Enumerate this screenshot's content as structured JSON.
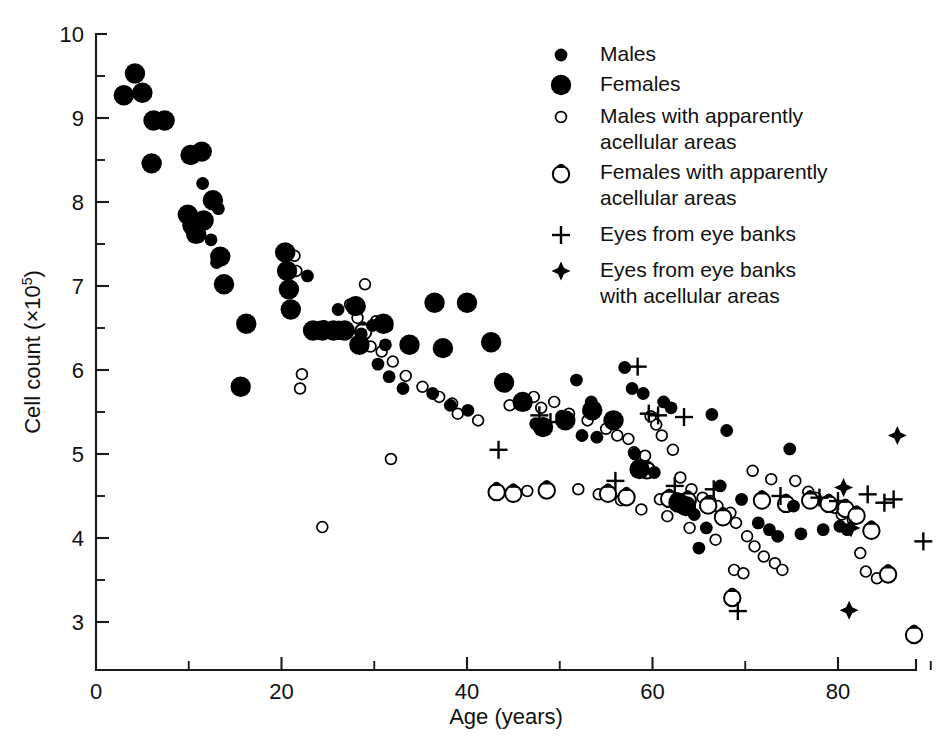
{
  "figure": {
    "width": 939,
    "height": 748,
    "background": "#ffffff",
    "ink_color": "#000000"
  },
  "axes": {
    "x_title": "Age (years)",
    "y_title_main": "Cell count (×10",
    "y_title_sup": "5",
    "y_title_tail": ")",
    "x_ticks": [
      "0",
      "20",
      "40",
      "60",
      "80"
    ],
    "y_ticks": [
      "3",
      "4",
      "5",
      "6",
      "7",
      "8",
      "9",
      "10"
    ]
  },
  "legend": {
    "items": [
      {
        "marker": "small-filled-circle",
        "label": "Males",
        "label2": ""
      },
      {
        "marker": "large-filled-circle",
        "label": "Females",
        "label2": ""
      },
      {
        "marker": "small-open-circle",
        "label": "Males with apparently",
        "label2": "acellular areas"
      },
      {
        "marker": "large-open-circle-notched",
        "label": "Females with apparently",
        "label2": "acellular areas"
      },
      {
        "marker": "plus",
        "label": "Eyes from eye banks",
        "label2": ""
      },
      {
        "marker": "filled-diamond-star",
        "label": "Eyes from eye banks",
        "label2": "with acellular areas"
      }
    ]
  },
  "chart_data": {
    "type": "scatter",
    "title": "",
    "xlabel": "Age (years)",
    "ylabel": "Cell count (×10^5)",
    "xlim": [
      0,
      90
    ],
    "ylim": [
      2.6,
      10
    ],
    "grid": false,
    "legend_position": "top-right",
    "x_major_step": 20,
    "x_minor_step": 10,
    "y_major_step": 1,
    "y_minor_step": 0.5,
    "series": [
      {
        "name": "Males",
        "marker": "small-filled-circle",
        "points": [
          [
            11.5,
            8.22
          ],
          [
            13.2,
            7.92
          ],
          [
            12.4,
            7.55
          ],
          [
            13.0,
            7.28
          ],
          [
            22.8,
            7.12
          ],
          [
            26.1,
            6.72
          ],
          [
            24.6,
            6.52
          ],
          [
            29.8,
            6.53
          ],
          [
            28.6,
            6.43
          ],
          [
            31.2,
            6.3
          ],
          [
            30.4,
            6.07
          ],
          [
            31.6,
            5.92
          ],
          [
            33.1,
            5.78
          ],
          [
            36.3,
            5.72
          ],
          [
            38.2,
            5.58
          ],
          [
            40.1,
            5.52
          ],
          [
            47.4,
            5.36
          ],
          [
            51.8,
            5.88
          ],
          [
            53.4,
            5.62
          ],
          [
            55.6,
            5.44
          ],
          [
            52.4,
            5.22
          ],
          [
            54.0,
            5.2
          ],
          [
            57.8,
            5.78
          ],
          [
            59.0,
            5.72
          ],
          [
            61.2,
            5.62
          ],
          [
            62.0,
            5.55
          ],
          [
            58.1,
            5.0
          ],
          [
            60.2,
            4.78
          ],
          [
            62.6,
            4.47
          ],
          [
            63.3,
            4.43
          ],
          [
            64.5,
            4.28
          ],
          [
            65.8,
            4.12
          ],
          [
            65.0,
            3.88
          ],
          [
            67.3,
            4.62
          ],
          [
            69.6,
            4.46
          ],
          [
            71.4,
            4.18
          ],
          [
            72.6,
            4.1
          ],
          [
            73.5,
            4.02
          ],
          [
            74.8,
            5.06
          ],
          [
            75.2,
            4.38
          ],
          [
            76.0,
            4.05
          ],
          [
            78.4,
            4.1
          ],
          [
            80.2,
            4.14
          ],
          [
            81.0,
            4.1
          ],
          [
            66.4,
            5.47
          ],
          [
            68.0,
            5.28
          ],
          [
            57.0,
            6.03
          ],
          [
            50.2,
            5.45
          ]
        ]
      },
      {
        "name": "Females",
        "marker": "large-filled-circle",
        "points": [
          [
            3.0,
            9.27
          ],
          [
            4.2,
            9.53
          ],
          [
            5.0,
            9.3
          ],
          [
            6.2,
            8.97
          ],
          [
            7.4,
            8.97
          ],
          [
            6.0,
            8.46
          ],
          [
            10.2,
            8.56
          ],
          [
            11.4,
            8.6
          ],
          [
            9.9,
            7.85
          ],
          [
            10.4,
            7.72
          ],
          [
            11.6,
            7.78
          ],
          [
            12.6,
            8.02
          ],
          [
            10.8,
            7.62
          ],
          [
            13.4,
            7.35
          ],
          [
            13.8,
            7.02
          ],
          [
            16.2,
            6.55
          ],
          [
            15.6,
            5.8
          ],
          [
            20.4,
            7.4
          ],
          [
            20.6,
            7.18
          ],
          [
            20.8,
            6.96
          ],
          [
            21.0,
            6.72
          ],
          [
            23.4,
            6.47
          ],
          [
            24.4,
            6.47
          ],
          [
            25.6,
            6.47
          ],
          [
            26.8,
            6.47
          ],
          [
            28.0,
            6.76
          ],
          [
            28.4,
            6.3
          ],
          [
            31.0,
            6.55
          ],
          [
            33.8,
            6.3
          ],
          [
            36.5,
            6.8
          ],
          [
            37.4,
            6.26
          ],
          [
            40.0,
            6.8
          ],
          [
            42.6,
            6.33
          ],
          [
            48.2,
            5.32
          ],
          [
            50.6,
            5.4
          ],
          [
            53.5,
            5.52
          ],
          [
            55.8,
            5.4
          ],
          [
            58.6,
            4.82
          ],
          [
            62.8,
            4.42
          ],
          [
            63.6,
            4.38
          ],
          [
            46.0,
            5.62
          ],
          [
            44.0,
            5.85
          ]
        ]
      },
      {
        "name": "Males with apparently acellular areas",
        "marker": "small-open-circle",
        "points": [
          [
            21.4,
            7.36
          ],
          [
            21.6,
            7.18
          ],
          [
            29.0,
            7.02
          ],
          [
            27.4,
            6.78
          ],
          [
            28.2,
            6.62
          ],
          [
            30.2,
            6.58
          ],
          [
            31.4,
            6.52
          ],
          [
            29.6,
            6.28
          ],
          [
            30.8,
            6.22
          ],
          [
            32.0,
            6.1
          ],
          [
            33.4,
            5.93
          ],
          [
            22.2,
            5.95
          ],
          [
            22.0,
            5.78
          ],
          [
            35.2,
            5.8
          ],
          [
            37.0,
            5.68
          ],
          [
            38.4,
            5.6
          ],
          [
            39.0,
            5.48
          ],
          [
            41.2,
            5.4
          ],
          [
            44.6,
            5.58
          ],
          [
            47.2,
            5.68
          ],
          [
            48.0,
            5.55
          ],
          [
            49.4,
            5.62
          ],
          [
            51.0,
            5.48
          ],
          [
            53.0,
            5.4
          ],
          [
            31.8,
            4.94
          ],
          [
            24.4,
            4.13
          ],
          [
            55.0,
            5.3
          ],
          [
            56.2,
            5.22
          ],
          [
            57.4,
            5.18
          ],
          [
            58.0,
            5.02
          ],
          [
            59.2,
            4.98
          ],
          [
            60.4,
            5.35
          ],
          [
            61.0,
            5.22
          ],
          [
            59.8,
            5.45
          ],
          [
            62.2,
            5.05
          ],
          [
            63.0,
            4.72
          ],
          [
            64.2,
            4.58
          ],
          [
            65.4,
            4.48
          ],
          [
            66.2,
            4.44
          ],
          [
            67.0,
            4.38
          ],
          [
            68.4,
            4.3
          ],
          [
            69.0,
            4.18
          ],
          [
            70.2,
            4.02
          ],
          [
            71.0,
            3.9
          ],
          [
            72.0,
            3.78
          ],
          [
            73.2,
            3.7
          ],
          [
            74.0,
            3.62
          ],
          [
            75.4,
            4.68
          ],
          [
            76.8,
            4.55
          ],
          [
            77.6,
            4.48
          ],
          [
            78.8,
            4.4
          ],
          [
            79.6,
            4.36
          ],
          [
            80.4,
            4.28
          ],
          [
            81.6,
            4.22
          ],
          [
            82.4,
            3.82
          ],
          [
            83.0,
            3.6
          ],
          [
            84.2,
            3.52
          ],
          [
            70.8,
            4.8
          ],
          [
            72.8,
            4.7
          ],
          [
            56.6,
            4.45
          ],
          [
            54.2,
            4.52
          ],
          [
            52.0,
            4.58
          ],
          [
            46.5,
            4.56
          ],
          [
            60.8,
            4.46
          ],
          [
            64.0,
            4.12
          ],
          [
            66.8,
            3.98
          ],
          [
            68.8,
            3.62
          ],
          [
            69.8,
            3.58
          ],
          [
            58.8,
            4.34
          ],
          [
            61.6,
            4.26
          ]
        ]
      },
      {
        "name": "Females with apparently acellular areas",
        "marker": "large-open-circle-notched",
        "points": [
          [
            26.2,
            6.48
          ],
          [
            28.8,
            6.47
          ],
          [
            43.2,
            4.56
          ],
          [
            45.0,
            4.54
          ],
          [
            59.4,
            4.82
          ],
          [
            61.8,
            4.48
          ],
          [
            63.8,
            4.46
          ],
          [
            66.0,
            4.4
          ],
          [
            67.6,
            4.26
          ],
          [
            68.6,
            3.3
          ],
          [
            71.8,
            4.46
          ],
          [
            74.4,
            4.42
          ],
          [
            77.0,
            4.46
          ],
          [
            79.0,
            4.42
          ],
          [
            80.8,
            4.36
          ],
          [
            82.0,
            4.28
          ],
          [
            83.6,
            4.1
          ],
          [
            85.4,
            3.58
          ],
          [
            88.2,
            2.86
          ],
          [
            48.6,
            4.58
          ],
          [
            55.2,
            4.54
          ],
          [
            57.2,
            4.5
          ]
        ]
      },
      {
        "name": "Eyes from eye banks",
        "marker": "plus",
        "points": [
          [
            43.4,
            5.05
          ],
          [
            47.8,
            5.46
          ],
          [
            49.0,
            5.38
          ],
          [
            58.4,
            6.04
          ],
          [
            59.6,
            5.48
          ],
          [
            60.6,
            5.46
          ],
          [
            63.4,
            5.44
          ],
          [
            56.0,
            4.68
          ],
          [
            62.4,
            4.62
          ],
          [
            66.6,
            4.58
          ],
          [
            69.2,
            3.13
          ],
          [
            73.8,
            4.5
          ],
          [
            78.0,
            4.48
          ],
          [
            83.2,
            4.52
          ],
          [
            86.0,
            4.46
          ],
          [
            89.2,
            3.96
          ],
          [
            80.0,
            4.44
          ],
          [
            85.0,
            4.42
          ]
        ]
      },
      {
        "name": "Eyes from eye banks with acellular areas",
        "marker": "filled-diamond-star",
        "points": [
          [
            86.4,
            5.22
          ],
          [
            80.6,
            4.6
          ],
          [
            81.4,
            4.12
          ],
          [
            81.2,
            3.14
          ]
        ]
      }
    ]
  }
}
